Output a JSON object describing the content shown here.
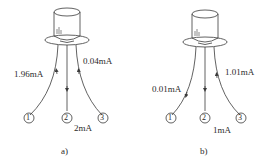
{
  "figure": {
    "panels": [
      {
        "id": "a",
        "caption": "a)",
        "pins": [
          "1",
          "2",
          "3"
        ],
        "currents": {
          "pin1": "1.96mA",
          "pin2": "2mA",
          "pin3": "0.04mA"
        },
        "arrow_directions": {
          "pin1": "into transistor (up)",
          "pin2": "out of transistor (down)",
          "pin3": "into transistor (up)"
        }
      },
      {
        "id": "b",
        "caption": "b)",
        "pins": [
          "1",
          "2",
          "3"
        ],
        "currents": {
          "pin1": "0.01mA",
          "pin2": "1mA",
          "pin3": "1.01mA"
        },
        "arrow_directions": {
          "pin1": "out of transistor (down)",
          "pin2": "out of transistor (down)",
          "pin3": "into transistor (up)"
        }
      }
    ],
    "line_color": "#3a3a3a"
  }
}
